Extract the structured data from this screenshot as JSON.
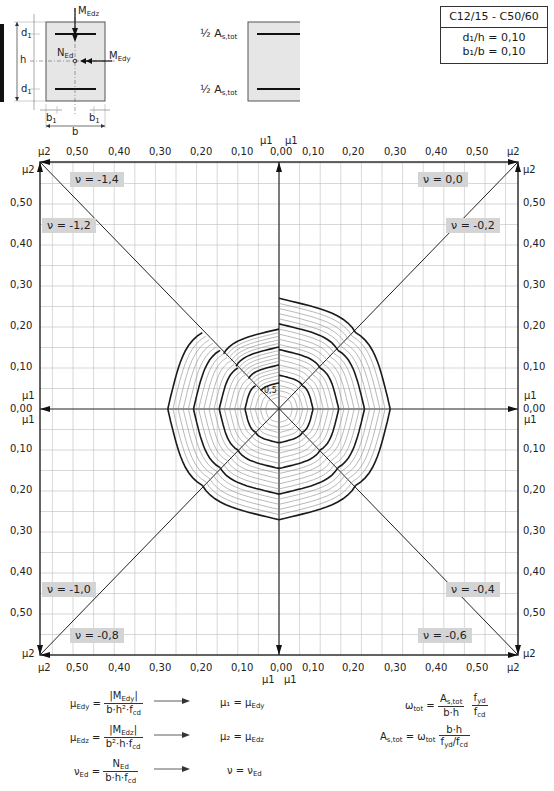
{
  "header": {
    "concrete_class": "C12/15 - C50/60",
    "ratio_d": "d₁/h = 0,10",
    "ratio_b": "b₁/b = 0,10"
  },
  "section_sketch": {
    "labels": {
      "M_Edz": "M",
      "M_Edz_sub": "Edz",
      "M_Edy": "M",
      "M_Edy_sub": "Edy",
      "N_Ed": "N",
      "N_Ed_sub": "Ed",
      "h": "h",
      "b": "b",
      "d1": "d",
      "d1_sub": "1",
      "b1": "b",
      "b1_sub": "1"
    },
    "reinforcement": {
      "top_label": "½ A",
      "top_label_sub": "s,tot",
      "bottom_label": "½ A",
      "bottom_label_sub": "s,tot"
    }
  },
  "chart_data": {
    "type": "line",
    "subtitle": "C12/15 - C50/60, d1/h = 0,10, b1/b = 0,10",
    "xlabel": "μ1 / μ2",
    "ylabel": "μ2 / μ1",
    "axis_ranges": {
      "mu1": [
        0,
        0.58
      ],
      "mu2": [
        0,
        0.6
      ]
    },
    "grid": true,
    "grid_step": 0.05,
    "top_ticks": [
      "μ2",
      "0,50",
      "0,40",
      "0,30",
      "0,20",
      "0,10",
      "0,00",
      "0,10",
      "0,20",
      "0,30",
      "0,40",
      "0,50",
      "μ2"
    ],
    "bottom_ticks": [
      "μ2",
      "0,50",
      "0,40",
      "0,30",
      "0,20",
      "0,10",
      "0,00",
      "0,10",
      "0,20",
      "0,30",
      "0,40",
      "0,50",
      "μ2"
    ],
    "left_ticks": [
      "μ2",
      "0,50",
      "0,40",
      "0,30",
      "0,20",
      "0,10",
      "0,00",
      "0,10",
      "0,20",
      "0,30",
      "0,40",
      "0,50",
      "μ2"
    ],
    "right_ticks": [
      "μ2",
      "0,50",
      "0,40",
      "0,30",
      "0,20",
      "0,10",
      "0,00",
      "0,10",
      "0,20",
      "0,30",
      "0,40",
      "0,50",
      "μ2"
    ],
    "axis_center_labels": {
      "top_left": "μ1",
      "top_right": "μ1",
      "bottom_left": "μ1",
      "bottom_right": "μ1",
      "left_up": "μ1",
      "left_down": "μ1",
      "right_up": "μ1",
      "right_down": "μ1"
    },
    "octants": [
      {
        "nu": "ν = -1,4",
        "position": "top-left-upper",
        "curves": [
          2.0
        ]
      },
      {
        "nu": "ν = -1,2",
        "position": "top-left-lower",
        "curves": [
          0.5,
          1.0,
          1.5,
          2.0
        ]
      },
      {
        "nu": "ν = 0,0",
        "position": "top-right-upper",
        "curves": [
          0.5,
          1.0,
          1.5,
          2.0
        ]
      },
      {
        "nu": "ν = -0,2",
        "position": "top-right-lower",
        "curves": [
          0.5,
          1.0,
          1.5,
          2.0
        ]
      },
      {
        "nu": "ν = -1,0",
        "position": "bottom-left-upper",
        "curves": [
          0.5,
          1.0,
          1.5,
          2.0
        ]
      },
      {
        "nu": "ν = -0,8",
        "position": "bottom-left-lower",
        "curves": [
          0.5,
          1.0,
          1.5,
          2.0
        ]
      },
      {
        "nu": "ν = -0,4",
        "position": "bottom-right-upper",
        "curves": [
          0.5,
          1.0,
          1.5,
          2.0
        ]
      },
      {
        "nu": "ν = -0,6",
        "position": "bottom-right-lower",
        "curves": [
          0.5,
          1.0,
          1.5,
          2.0
        ]
      }
    ],
    "curve_label_prefix": "ωtot =",
    "curve_values": [
      "0,5",
      "1,0",
      "1,5",
      "2,0"
    ],
    "center_label": "0,5",
    "series": [
      {
        "name": "ωtot = 0,5",
        "emphasis": "bold"
      },
      {
        "name": "ωtot = 1,0",
        "emphasis": "bold"
      },
      {
        "name": "ωtot = 1,5",
        "emphasis": "bold"
      },
      {
        "name": "ωtot = 2,0",
        "emphasis": "bold"
      },
      {
        "name": "intermediate ωtot (step 0,1)",
        "emphasis": "thin"
      }
    ]
  },
  "formulas": {
    "mu_edy_lhs": "μ",
    "mu_edy_lhs_sub": "Edy",
    "mu_edy_num": "|M",
    "mu_edy_num_sub": "Edy",
    "mu_edy_num_end": "|",
    "mu_edy_den": "b·h²·f",
    "mu_edy_den_sub": "cd",
    "mu1_eq": "μ₁ = μ",
    "mu1_eq_sub": "Edy",
    "mu_edz_lhs": "μ",
    "mu_edz_lhs_sub": "Edz",
    "mu_edz_num": "|M",
    "mu_edz_num_sub": "Edz",
    "mu_edz_num_end": "|",
    "mu_edz_den": "b²·h·f",
    "mu_edz_den_sub": "cd",
    "mu2_eq": "μ₂ = μ",
    "mu2_eq_sub": "Edz",
    "nu_ed_lhs": "ν",
    "nu_ed_lhs_sub": "Ed",
    "nu_ed_num": "N",
    "nu_ed_num_sub": "Ed",
    "nu_ed_den": "b·h·f",
    "nu_ed_den_sub": "cd",
    "nu_eq": "ν = ν",
    "nu_eq_sub": "Ed",
    "omega_lhs": "ω",
    "omega_lhs_sub": "tot",
    "omega_num1": "A",
    "omega_num1_sub": "s,tot",
    "omega_den1": "b·h",
    "omega_num2": "f",
    "omega_num2_sub": "yd",
    "omega_den2": "f",
    "omega_den2_sub": "cd",
    "as_lhs": "A",
    "as_lhs_sub": "s,tot",
    "as_mid": "= ω",
    "as_mid_sub": "tot",
    "as_num": "b·h",
    "as_den": "f",
    "as_den_sub": "yd",
    "as_den_mid": "/f",
    "as_den_sub2": "cd"
  },
  "colors": {
    "grid": "#bdbdbd",
    "thin_curve": "#8a8a8a",
    "bold_curve": "#1a1a1a",
    "nu_label_bg": "#d4d4d4",
    "section_fill": "#e6e6e6"
  }
}
